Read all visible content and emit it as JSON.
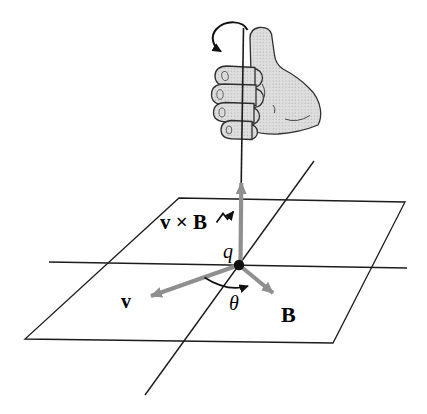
{
  "figure": {
    "type": "physics-diagram",
    "topic": "Right-hand rule for the direction of the cross product v × B of a charge q",
    "labels": {
      "cross_product": "v × B",
      "charge": "q",
      "velocity": "v",
      "magnetic_field": "B",
      "angle": "θ"
    },
    "elements": {
      "hand": "right-hand with thumb pointing up along vertical axis, fingers curling from v toward B",
      "rotation_arrow": "curved arrow at top of axis showing curl direction",
      "axis": "vertical axis through q with upward gray arrow (v × B direction)",
      "plane": "slanted plane containing vectors v and B with two reference lines crossing at q",
      "angle_arc": "arc from v to B marking angle θ"
    },
    "colors": {
      "background": "#ffffff",
      "line": "#1c1c1c",
      "vector_gray": "#8f8f8f",
      "hand_fill": "#dedede",
      "hand_stroke": "#2f2f2f",
      "dot": "#111111"
    }
  }
}
